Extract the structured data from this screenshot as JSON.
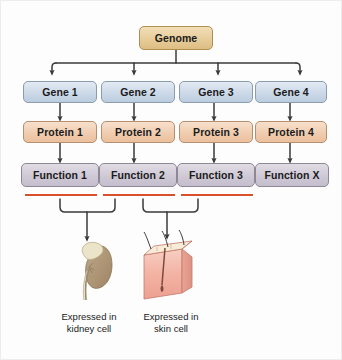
{
  "diagram": {
    "genome": {
      "label": "Genome"
    },
    "genes": [
      {
        "label": "Gene 1"
      },
      {
        "label": "Gene 2"
      },
      {
        "label": "Gene 3"
      },
      {
        "label": "Gene 4"
      }
    ],
    "proteins": [
      {
        "label": "Protein 1"
      },
      {
        "label": "Protein 2"
      },
      {
        "label": "Protein 3"
      },
      {
        "label": "Protein 4"
      }
    ],
    "functions": [
      {
        "label": "Function 1",
        "underlined": true
      },
      {
        "label": "Function 2",
        "underlined": true
      },
      {
        "label": "Function 3",
        "underlined": true
      },
      {
        "label": "Function X",
        "underlined": false
      }
    ],
    "outcomes": [
      {
        "icon": "kidney-icon",
        "caption_line1": "Expressed in",
        "caption_line2": "kidney cell"
      },
      {
        "icon": "skin-block-icon",
        "caption_line1": "Expressed in",
        "caption_line2": "skin cell"
      }
    ],
    "colors": {
      "genome_fill": "#e7cd9a",
      "gene_fill": "#ccd9e8",
      "protein_fill": "#f0cdb0",
      "function_fill": "#cfc9d6",
      "underline": "#d9512c",
      "connector": "#3a3a3a",
      "background": "#fdfdfd",
      "kidney": "#b09878",
      "adrenal": "#ece4c8",
      "skin": "#f2b6a8"
    }
  }
}
